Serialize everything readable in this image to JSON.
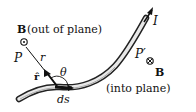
{
  "diagram": {
    "labels": {
      "b_out_bold": "B",
      "b_out_text": "(out of plane)",
      "point_p": "P",
      "distance_r": "r",
      "unit_vector_r": "r̂",
      "angle_theta": "θ",
      "element_ds": "ds",
      "current_i": "I",
      "point_p_prime": "P′",
      "b_in_bold": "B",
      "b_in_text": "(into plane)"
    },
    "symbols": {
      "out_of_plane": "dot-in-circle",
      "into_plane": "cross-in-circle"
    },
    "colors": {
      "ink": "#111111",
      "wire_fill": "#e8e8e8",
      "background": "#ffffff"
    }
  }
}
